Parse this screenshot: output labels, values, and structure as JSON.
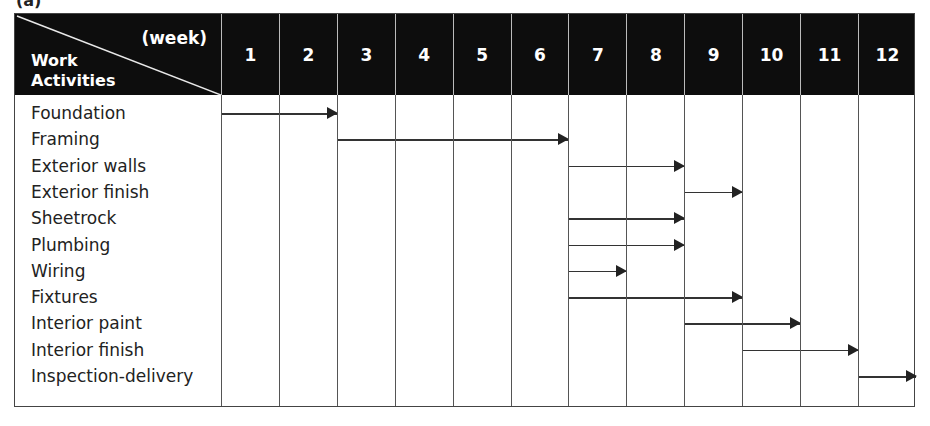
{
  "figure": {
    "label": "(a)"
  },
  "header": {
    "corner_week_label": "(week)",
    "corner_activity_label_line1": "Work",
    "corner_activity_label_line2": "Activities",
    "weeks": [
      "1",
      "2",
      "3",
      "4",
      "5",
      "6",
      "7",
      "8",
      "9",
      "10",
      "11",
      "12"
    ]
  },
  "activities": [
    {
      "name": "Foundation",
      "start_week": 1,
      "end_week": 2
    },
    {
      "name": "Framing",
      "start_week": 3,
      "end_week": 6
    },
    {
      "name": "Exterior walls",
      "start_week": 7,
      "end_week": 8
    },
    {
      "name": "Exterior finish",
      "start_week": 9,
      "end_week": 9
    },
    {
      "name": "Sheetrock",
      "start_week": 7,
      "end_week": 8
    },
    {
      "name": "Plumbing",
      "start_week": 7,
      "end_week": 8
    },
    {
      "name": "Wiring",
      "start_week": 7,
      "end_week": 7
    },
    {
      "name": "Fixtures",
      "start_week": 7,
      "end_week": 9
    },
    {
      "name": "Interior paint",
      "start_week": 9,
      "end_week": 10
    },
    {
      "name": "Interior finish",
      "start_week": 10,
      "end_week": 11
    },
    {
      "name": "Inspection-delivery",
      "start_week": 12,
      "end_week": 12
    }
  ],
  "colors": {
    "header_bg": "#0d0d0d",
    "header_text": "#ffffff",
    "grid": "#555555",
    "arrow": "#222222"
  },
  "chart_data": {
    "type": "gantt",
    "title": "",
    "xlabel": "(week)",
    "ylabel": "Work Activities",
    "categories": [
      "Foundation",
      "Framing",
      "Exterior walls",
      "Exterior finish",
      "Sheetrock",
      "Plumbing",
      "Wiring",
      "Fixtures",
      "Interior paint",
      "Interior finish",
      "Inspection-delivery"
    ],
    "x_ticks": [
      1,
      2,
      3,
      4,
      5,
      6,
      7,
      8,
      9,
      10,
      11,
      12
    ],
    "xlim": [
      1,
      12
    ],
    "series": [
      {
        "name": "start_week",
        "values": [
          1,
          3,
          7,
          9,
          7,
          7,
          7,
          7,
          9,
          10,
          12
        ]
      },
      {
        "name": "end_week",
        "values": [
          2,
          6,
          8,
          9,
          8,
          8,
          7,
          9,
          10,
          11,
          12
        ]
      }
    ],
    "grid": true,
    "legend": null
  }
}
